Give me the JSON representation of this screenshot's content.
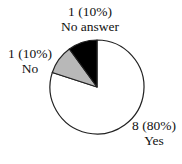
{
  "chart_data": {
    "type": "pie",
    "title": "",
    "categories": [
      "Yes",
      "No",
      "No answer"
    ],
    "values": [
      8,
      1,
      1
    ],
    "percentages": [
      80,
      10,
      10
    ],
    "colors": [
      "#ffffff",
      "#b8b8b8",
      "#000000"
    ],
    "start_angle": "12 o'clock",
    "direction": "clockwise",
    "labels": [
      {
        "count": "8 (80%)",
        "name": "Yes"
      },
      {
        "count": "1 (10%)",
        "name": "No"
      },
      {
        "count": "1 (10%)",
        "name": "No answer"
      }
    ],
    "legend": "none"
  }
}
